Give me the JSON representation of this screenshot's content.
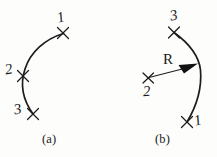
{
  "figure": {
    "background_color": "#fdfdfb",
    "ink_color": "#1d1d1f",
    "panels": [
      {
        "id": "a",
        "caption": "(a)",
        "caption_x": 42,
        "caption_y": 134,
        "arc": {
          "type": "three-point-arc",
          "bulge_direction": "left",
          "start": [
            63,
            33
          ],
          "end": [
            33,
            114
          ],
          "path": "M 63.5 33.5 C 45 39 30.5 52 25 69 C 20 84 23 100 33 114"
        },
        "markers": [
          {
            "label": "1",
            "x": 63,
            "y": 33,
            "label_x": 57,
            "label_y": 10,
            "role": "arc-point"
          },
          {
            "label": "2",
            "x": 23,
            "y": 76,
            "label_x": 5,
            "label_y": 62,
            "role": "arc-point"
          },
          {
            "label": "3",
            "x": 33,
            "y": 114,
            "label_x": 14,
            "label_y": 103,
            "role": "arc-point"
          }
        ]
      },
      {
        "id": "b",
        "caption": "(b)",
        "caption_x": 155,
        "caption_y": 134,
        "arc": {
          "type": "center-radius-arc",
          "bulge_direction": "right",
          "start": [
            174,
            32
          ],
          "end": [
            187,
            122
          ],
          "path": "M 174 32.5 C 190 44 199 57 200.5 70 C 202 88 196 107 187 122"
        },
        "radius": {
          "label": "R",
          "label_x": 164,
          "label_y": 54,
          "from": [
            148,
            78
          ],
          "to": [
            197,
            65
          ],
          "arrow_head": "197,65 180,64.5 183,72.5"
        },
        "markers": [
          {
            "label": "3",
            "x": 174,
            "y": 32,
            "label_x": 170,
            "label_y": 9,
            "role": "arc-endpoint"
          },
          {
            "label": "2",
            "x": 148,
            "y": 78,
            "label_x": 143,
            "label_y": 84,
            "role": "arc-center"
          },
          {
            "label": "1",
            "x": 187,
            "y": 122,
            "label_x": 194,
            "label_y": 114,
            "role": "arc-endpoint"
          }
        ]
      }
    ]
  }
}
